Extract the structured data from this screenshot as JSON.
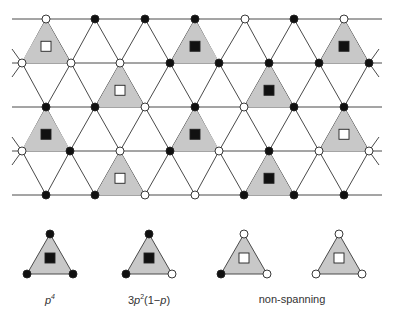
{
  "figure": {
    "colors": {
      "line": "#4a4a4a",
      "triangle_fill": "#c8c8c8",
      "occupied_node": "#111111",
      "empty_node": "#ffffff",
      "square_filled": "#111111",
      "square_empty": "#ffffff"
    },
    "lattice": {
      "rows_y": [
        19,
        63,
        107,
        151,
        195
      ],
      "line_x_start": 12,
      "line_x_end": 382,
      "nodes": [
        {
          "x": 46,
          "y": 19,
          "s": 0
        },
        {
          "x": 95,
          "y": 19,
          "s": 1
        },
        {
          "x": 145,
          "y": 19,
          "s": 1
        },
        {
          "x": 195,
          "y": 19,
          "s": 1
        },
        {
          "x": 245,
          "y": 19,
          "s": 0
        },
        {
          "x": 294,
          "y": 19,
          "s": 1
        },
        {
          "x": 344,
          "y": 19,
          "s": 0
        },
        {
          "x": 22,
          "y": 63,
          "s": 0
        },
        {
          "x": 71,
          "y": 63,
          "s": 0
        },
        {
          "x": 120,
          "y": 63,
          "s": 0
        },
        {
          "x": 170,
          "y": 63,
          "s": 1
        },
        {
          "x": 219,
          "y": 63,
          "s": 1
        },
        {
          "x": 269,
          "y": 63,
          "s": 1
        },
        {
          "x": 319,
          "y": 63,
          "s": 1
        },
        {
          "x": 369,
          "y": 63,
          "s": 1
        },
        {
          "x": 46,
          "y": 107,
          "s": 1
        },
        {
          "x": 95,
          "y": 107,
          "s": 1
        },
        {
          "x": 145,
          "y": 107,
          "s": 0
        },
        {
          "x": 195,
          "y": 107,
          "s": 1
        },
        {
          "x": 244,
          "y": 107,
          "s": 0
        },
        {
          "x": 294,
          "y": 107,
          "s": 1
        },
        {
          "x": 344,
          "y": 107,
          "s": 1
        },
        {
          "x": 22,
          "y": 151,
          "s": 0
        },
        {
          "x": 70,
          "y": 151,
          "s": 1
        },
        {
          "x": 120,
          "y": 151,
          "s": 0
        },
        {
          "x": 170,
          "y": 151,
          "s": 1
        },
        {
          "x": 219,
          "y": 151,
          "s": 0
        },
        {
          "x": 269,
          "y": 151,
          "s": 1
        },
        {
          "x": 319,
          "y": 151,
          "s": 0
        },
        {
          "x": 369,
          "y": 151,
          "s": 0
        },
        {
          "x": 46,
          "y": 195,
          "s": 1
        },
        {
          "x": 95,
          "y": 195,
          "s": 1
        },
        {
          "x": 145,
          "y": 195,
          "s": 0
        },
        {
          "x": 195,
          "y": 195,
          "s": 0
        },
        {
          "x": 244,
          "y": 195,
          "s": 1
        },
        {
          "x": 294,
          "y": 195,
          "s": 1
        },
        {
          "x": 344,
          "y": 195,
          "s": 1
        }
      ],
      "shaded_triangles": [
        {
          "apex_x": 46,
          "apex_y": 19,
          "filled": false
        },
        {
          "apex_x": 195,
          "apex_y": 19,
          "filled": true
        },
        {
          "apex_x": 344,
          "apex_y": 19,
          "filled": true
        },
        {
          "apex_x": 120,
          "apex_y": 63,
          "filled": false
        },
        {
          "apex_x": 269,
          "apex_y": 63,
          "filled": true
        },
        {
          "apex_x": 46,
          "apex_y": 107,
          "filled": true
        },
        {
          "apex_x": 195,
          "apex_y": 107,
          "filled": true
        },
        {
          "apex_x": 344,
          "apex_y": 107,
          "filled": false
        },
        {
          "apex_x": 120,
          "apex_y": 151,
          "filled": false
        },
        {
          "apex_x": 269,
          "apex_y": 151,
          "filled": true
        }
      ]
    },
    "legend": {
      "items": [
        {
          "cx": 50,
          "nodes": [
            1,
            1,
            1
          ],
          "filled": true,
          "label_html": "p⁴"
        },
        {
          "cx": 149,
          "nodes": [
            1,
            1,
            0
          ],
          "filled": true,
          "label_html": "3p²(1−p)"
        },
        {
          "cx": 244,
          "nodes": [
            0,
            1,
            0
          ],
          "filled": false,
          "label_html": ""
        },
        {
          "cx": 339,
          "nodes": [
            0,
            0,
            0
          ],
          "filled": false,
          "label_html": ""
        }
      ],
      "labels": {
        "p4_base": "p",
        "p4_exp": "4",
        "three_p2_prefix": "3",
        "three_p2_base": "p",
        "three_p2_exp": "2",
        "three_p2_suffix_open": "(1−",
        "three_p2_suffix_p": "p",
        "three_p2_suffix_close": ")",
        "non_spanning": "non-spanning"
      }
    }
  }
}
